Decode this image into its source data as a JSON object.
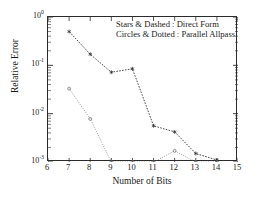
{
  "chart_data": {
    "type": "line",
    "title": "",
    "xlabel": "Number of Bits",
    "ylabel": "Relative Error",
    "xlim": [
      6,
      15
    ],
    "ylim": [
      0.001,
      1
    ],
    "yscale": "log",
    "xscale": "linear",
    "grid": false,
    "legend_position": "upper-right-inside",
    "xticks": [
      "6",
      "7",
      "8",
      "9",
      "10",
      "11",
      "12",
      "13",
      "14",
      "15"
    ],
    "xtick_values": [
      6,
      7,
      8,
      9,
      10,
      11,
      12,
      13,
      14,
      15
    ],
    "ytick_labels": [
      "10",
      "10",
      "10",
      "10"
    ],
    "ytick_exponents": [
      "0",
      "-1",
      "-2",
      "-3"
    ],
    "ytick_values": [
      1,
      0.1,
      0.01,
      0.001
    ],
    "series": [
      {
        "name": "Direct Form",
        "marker": "star",
        "linestyle": "dashed",
        "color": "#2b2b2b",
        "x": [
          7,
          8,
          9,
          10,
          11,
          12,
          13,
          14
        ],
        "values": [
          0.5,
          0.17,
          0.072,
          0.085,
          0.0056,
          0.0042,
          0.0015,
          0.0011
        ]
      },
      {
        "name": "Parallel Allpass",
        "marker": "circle",
        "linestyle": "dotted",
        "color": "#6b6b6b",
        "x": [
          7,
          8,
          9,
          10,
          11,
          12,
          13,
          14
        ],
        "values": [
          0.033,
          0.0078,
          0.001,
          0.001,
          0.001,
          0.0017,
          0.001,
          0.001
        ]
      }
    ],
    "annotations": [
      "Stars & Dashed : Direct Form",
      "Circles & Dotted : Parallel Allpass"
    ]
  },
  "legend": {
    "line1": "Stars & Dashed : Direct Form",
    "line2": "Circles & Dotted : Parallel Allpass"
  },
  "axes": {
    "x_title": "Number of Bits",
    "y_title": "Relative Error"
  }
}
